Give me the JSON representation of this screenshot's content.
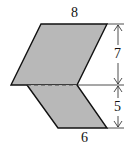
{
  "diagram": {
    "labels": {
      "top": "8",
      "bottom": "6",
      "upper_height": "7",
      "lower_height": "5"
    },
    "colors": {
      "fill": "#b8b8b8",
      "stroke": "#111111"
    }
  }
}
